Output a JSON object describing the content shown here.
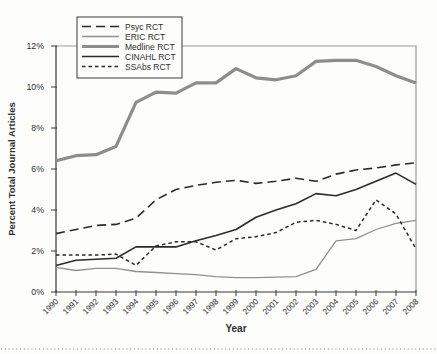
{
  "figure": {
    "background": "#fdfdfb",
    "frame_color": "#9b9b9b",
    "axis_color": "#3a3a3a",
    "text_color": "#2f2f2f",
    "separator_color": "#8a8a8a"
  },
  "chart_data": {
    "type": "line",
    "title": "",
    "xlabel": "Year",
    "ylabel": "Percent Total Journal Articles",
    "grid": false,
    "legend_position": "top-left",
    "ylim": [
      0,
      12
    ],
    "y_ticks": [
      0,
      2,
      4,
      6,
      8,
      10,
      12
    ],
    "y_tick_labels": [
      "0%",
      "2%",
      "4%",
      "6%",
      "8%",
      "10%",
      "12%"
    ],
    "x": [
      1990,
      1991,
      1992,
      1993,
      1994,
      1995,
      1996,
      1997,
      1998,
      1999,
      2000,
      2001,
      2002,
      2003,
      2004,
      2005,
      2006,
      2007,
      2008
    ],
    "x_tick_labels": [
      "1990",
      "1991",
      "1992",
      "1993",
      "1994",
      "1995",
      "1996",
      "1997",
      "1998",
      "1999",
      "2000",
      "2001",
      "2002",
      "2003",
      "2004",
      "2005",
      "2006",
      "2007",
      "2008"
    ],
    "series": [
      {
        "name": "Psyc RCT",
        "line_style": "long-dash",
        "color": "#2b2b2b",
        "width": 1.6,
        "dash": "9,5",
        "values": [
          2.85,
          3.05,
          3.25,
          3.3,
          3.6,
          4.5,
          5.0,
          5.2,
          5.35,
          5.45,
          5.3,
          5.4,
          5.55,
          5.4,
          5.75,
          5.95,
          6.05,
          6.2,
          6.3
        ]
      },
      {
        "name": "ERIC RCT",
        "line_style": "solid-thin",
        "color": "#909090",
        "width": 1.3,
        "dash": "",
        "values": [
          1.2,
          1.05,
          1.15,
          1.15,
          1.0,
          0.95,
          0.9,
          0.85,
          0.75,
          0.7,
          0.7,
          0.72,
          0.75,
          1.1,
          2.5,
          2.6,
          3.05,
          3.35,
          3.5
        ]
      },
      {
        "name": "Medline RCT",
        "line_style": "solid-thick",
        "color": "#8d8d8d",
        "width": 3.2,
        "dash": "",
        "values": [
          6.4,
          6.65,
          6.7,
          7.1,
          9.25,
          9.75,
          9.7,
          10.2,
          10.2,
          10.9,
          10.45,
          10.35,
          10.55,
          11.25,
          11.3,
          11.3,
          11.0,
          10.55,
          10.2
        ]
      },
      {
        "name": "CINAHL RCT",
        "line_style": "solid",
        "color": "#2b2b2b",
        "width": 1.6,
        "dash": "",
        "values": [
          1.3,
          1.55,
          1.6,
          1.65,
          2.2,
          2.2,
          2.2,
          2.5,
          2.75,
          3.05,
          3.65,
          4.0,
          4.3,
          4.8,
          4.7,
          5.0,
          5.4,
          5.8,
          5.25
        ]
      },
      {
        "name": "SSAbs RCT",
        "line_style": "short-dash",
        "color": "#2b2b2b",
        "width": 1.5,
        "dash": "3.5,3",
        "values": [
          1.8,
          1.8,
          1.8,
          1.85,
          1.3,
          2.25,
          2.45,
          2.45,
          2.05,
          2.6,
          2.7,
          2.9,
          3.4,
          3.5,
          3.3,
          3.0,
          4.5,
          3.8,
          2.1
        ]
      }
    ]
  }
}
